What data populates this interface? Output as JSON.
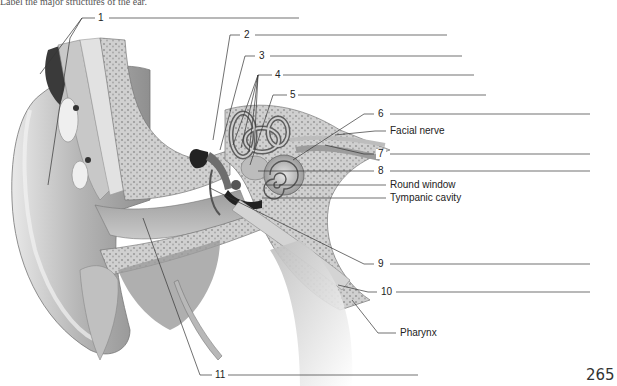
{
  "figure": {
    "caption_fragment": "Label the major structures of the ear.",
    "page_number": "265"
  },
  "labels": {
    "n1": "1",
    "n2": "2",
    "n3": "3",
    "n4": "4",
    "n5": "5",
    "n6": "6",
    "facial_nerve": "Facial nerve",
    "n7": "7",
    "n8": "8",
    "round_window": "Round window",
    "tympanic_cavity": "Tympanic cavity",
    "n9": "9",
    "n10": "10",
    "pharynx": "Pharynx",
    "n11": "11"
  },
  "answer_blanks": [
    {
      "number": "1",
      "answer": ""
    },
    {
      "number": "2",
      "answer": ""
    },
    {
      "number": "3",
      "answer": ""
    },
    {
      "number": "4",
      "answer": ""
    },
    {
      "number": "5",
      "answer": ""
    },
    {
      "number": "6",
      "answer": ""
    },
    {
      "number": "7",
      "answer": ""
    },
    {
      "number": "8",
      "answer": ""
    },
    {
      "number": "9",
      "answer": ""
    },
    {
      "number": "10",
      "answer": ""
    },
    {
      "number": "11",
      "answer": ""
    }
  ],
  "colors": {
    "line": "#333333",
    "tissue_light": "#d9d9d9",
    "tissue_mid": "#a8a8a8",
    "tissue_dark": "#555555",
    "bone": "#bdbdbd"
  }
}
